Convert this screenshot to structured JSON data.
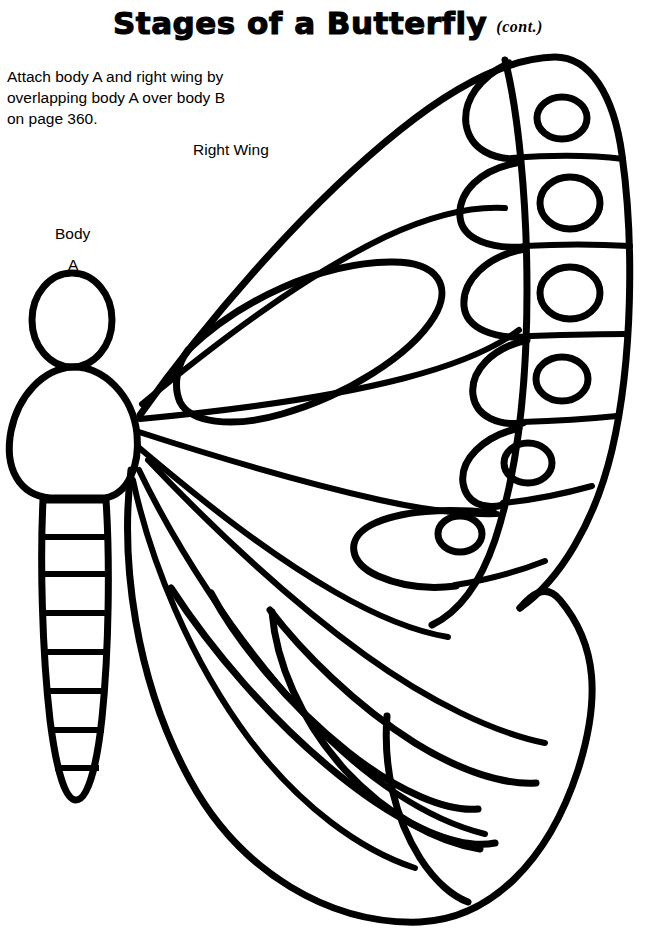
{
  "page": {
    "background_color": "#ffffff",
    "ink_color": "#000000",
    "width": 656,
    "height": 935
  },
  "header": {
    "title": "Stages of a Butterfly",
    "continued_note": "(cont.)"
  },
  "instructions": {
    "text": "Attach body A and right wing by\noverlapping body A over body B\non page 360.",
    "line1": "Attach body A and right wing by",
    "line2": "overlapping body A over body B",
    "line3": "on page 360.",
    "page_reference": "360"
  },
  "labels": {
    "right_wing": "Right Wing",
    "body": "Body",
    "body_letter": "A"
  },
  "illustration": {
    "name": "butterfly-outline",
    "description": "Line-art butterfly cut-out with right wing and body A",
    "stroke_color": "#000000",
    "stroke_width": 7,
    "fill_color": "#ffffff",
    "parts": [
      {
        "name": "head",
        "shape": "oval"
      },
      {
        "name": "thorax",
        "shape": "rounded-body"
      },
      {
        "name": "abdomen",
        "shape": "segmented-taper",
        "segment_count": 8
      },
      {
        "name": "forewing",
        "shape": "upper-wing"
      },
      {
        "name": "hindwing",
        "shape": "lower-wing"
      }
    ],
    "eyespot_count": 6,
    "eyespots": [
      {
        "index": 1,
        "cx": 562,
        "cy": 118,
        "rx": 25,
        "ry": 21
      },
      {
        "index": 2,
        "cx": 570,
        "cy": 203,
        "rx": 30,
        "ry": 26
      },
      {
        "index": 3,
        "cx": 570,
        "cy": 293,
        "rx": 30,
        "ry": 26
      },
      {
        "index": 4,
        "cx": 562,
        "cy": 379,
        "rx": 26,
        "ry": 22
      },
      {
        "index": 5,
        "cx": 528,
        "cy": 463,
        "rx": 24,
        "ry": 20
      },
      {
        "index": 6,
        "cx": 460,
        "cy": 534,
        "rx": 22,
        "ry": 18
      }
    ]
  }
}
